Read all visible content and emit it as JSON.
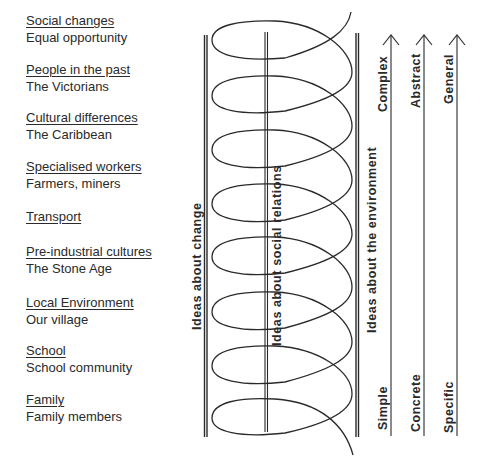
{
  "topics": [
    {
      "heading": "Social changes",
      "example": "Equal opportunity"
    },
    {
      "heading": "People in the past",
      "example": "The Victorians"
    },
    {
      "heading": "Cultural differences",
      "example": "The Caribbean"
    },
    {
      "heading": "Specialised workers",
      "example": "Farmers, miners"
    },
    {
      "heading": "Transport",
      "example": ""
    },
    {
      "heading": "Pre-industrial cultures",
      "example": "The Stone Age"
    },
    {
      "heading": "Local Environment",
      "example": "Our village"
    },
    {
      "heading": "School",
      "example": "School community"
    },
    {
      "heading": "Family",
      "example": "Family members"
    }
  ],
  "strands": {
    "change": "Ideas  about  change",
    "social": "Ideas  about  social  relations",
    "environment": "Ideas  about  the  environment"
  },
  "progressions": [
    {
      "low": "Simple",
      "high": "Complex"
    },
    {
      "low": "Concrete",
      "high": "Abstract"
    },
    {
      "low": "Specific",
      "high": "General"
    }
  ],
  "colors": {
    "ink": "#2a2a2a",
    "background": "#ffffff"
  }
}
